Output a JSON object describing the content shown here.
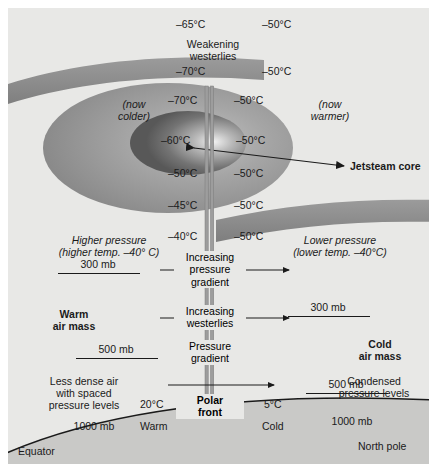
{
  "diagram": {
    "colors": {
      "panel_bg": "#e8e8e6",
      "tropopause_band": "#8d8d8d",
      "jetstream_outer": "#9a9a9a",
      "jetstream_core": "#666666",
      "ground": "#c9c9c7",
      "ink": "#1a1a1a"
    },
    "top_temps": [
      {
        "value": "–65°C",
        "x": 176,
        "y": 10
      },
      {
        "value": "–50°C",
        "x": 262,
        "y": 10
      },
      {
        "value": "–70°C",
        "x": 176,
        "y": 57
      },
      {
        "value": "–50°C",
        "x": 262,
        "y": 57
      }
    ],
    "weakening_westerlies": "Weakening\nwesterlies",
    "weakening_westerlies_line1": "Weakening",
    "weakening_westerlies_line2": "westerlies",
    "now_colder_line1": "(now",
    "now_colder_line2": "colder)",
    "now_warmer_line1": "(now",
    "now_warmer_line2": "warmer)",
    "ellipse_temps": [
      {
        "value": "–70°C",
        "x": 141,
        "y": 86
      },
      {
        "value": "–50°C",
        "x": 238,
        "y": 86
      },
      {
        "value": "–60°C",
        "x": 135,
        "y": 126
      },
      {
        "value": "–50°C",
        "x": 240,
        "y": 126
      },
      {
        "value": "–50°C",
        "x": 143,
        "y": 160
      },
      {
        "value": "–50°C",
        "x": 238,
        "y": 160
      },
      {
        "value": "–45°C",
        "x": 143,
        "y": 191
      },
      {
        "value": "–50°C",
        "x": 238,
        "y": 191
      },
      {
        "value": "–40°C",
        "x": 145,
        "y": 222
      },
      {
        "value": "–50°C",
        "x": 238,
        "y": 222
      }
    ],
    "jetstream_core_label": "Jetsteam core",
    "higher_pressure_line1": "Higher pressure",
    "higher_pressure_line2": "(higher temp. –40° C)",
    "lower_pressure_line1": "Lower pressure",
    "lower_pressure_line2": "(lower  temp. –40°C)",
    "increasing_pressure_gradient_line1": "Increasing",
    "increasing_pressure_gradient_line2": "pressure",
    "increasing_pressure_gradient_line3": "gradient",
    "increasing_westerlies_line1": "Increasing",
    "increasing_westerlies_line2": "westerlies",
    "pressure_gradient_line1": "Pressure",
    "pressure_gradient_line2": "gradient",
    "polar_front_line1": "Polar",
    "polar_front_line2": "front",
    "warm_air_mass_line1": "Warm",
    "warm_air_mass_line2": "air mass",
    "cold_air_mass_line1": "Cold",
    "cold_air_mass_line2": "air mass",
    "less_dense_line1": "Less dense air",
    "less_dense_line2": "with spaced",
    "less_dense_line3": "pressure levels",
    "condensed_line1": "Condensed",
    "condensed_line2": "pressure levels",
    "pressure_levels": [
      {
        "label": "300 mb",
        "side": "left",
        "x": 74,
        "y": 257
      },
      {
        "label": "300 mb",
        "side": "right",
        "x": 320,
        "y": 300
      },
      {
        "label": "500 mb",
        "side": "left",
        "x": 93,
        "y": 342
      },
      {
        "label": "500 mb",
        "side": "right",
        "x": 338,
        "y": 377
      },
      {
        "label": "1000 mb",
        "side": "left",
        "x": 79,
        "y": 420
      },
      {
        "label": "1000 mb",
        "side": "right",
        "x": 340,
        "y": 416
      }
    ],
    "surface_temps": [
      {
        "value": "20°C",
        "x": 145,
        "y": 395
      },
      {
        "value": "5°C",
        "x": 264,
        "y": 395
      }
    ],
    "surface_air": [
      {
        "value": "Warm",
        "x": 145,
        "y": 417
      },
      {
        "value": "Cold",
        "x": 262,
        "y": 417
      }
    ],
    "equator_label": "Equator",
    "north_pole_label": "North pole"
  }
}
